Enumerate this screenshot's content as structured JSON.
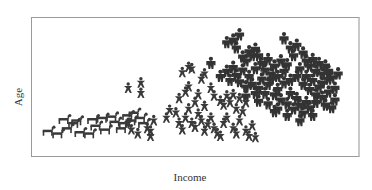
{
  "chart_data": {
    "type": "scatter",
    "title": "",
    "xlabel": "Income",
    "ylabel": "Age",
    "xlim": [
      0,
      100
    ],
    "ylim": [
      0,
      100
    ],
    "grid": false,
    "legend": null,
    "marker_colors": {
      "dog": "#3a3a3a",
      "child": "#3a3a3a",
      "adult": "#333333"
    },
    "series": [
      {
        "name": "dogs",
        "marker": "dog",
        "points": [
          [
            4,
            16
          ],
          [
            7,
            14
          ],
          [
            10,
            18
          ],
          [
            12,
            22
          ],
          [
            14,
            15
          ],
          [
            17,
            14
          ],
          [
            19,
            20
          ],
          [
            22,
            17
          ],
          [
            25,
            23
          ],
          [
            27,
            18
          ],
          [
            28,
            22
          ],
          [
            30,
            24
          ],
          [
            9,
            25
          ],
          [
            13,
            24
          ],
          [
            18,
            25
          ],
          [
            21,
            26
          ],
          [
            24,
            27
          ],
          [
            29,
            28
          ],
          [
            31,
            30
          ],
          [
            33,
            26
          ],
          [
            34,
            22
          ]
        ]
      },
      {
        "name": "children",
        "marker": "child",
        "points": [
          [
            29,
            49
          ],
          [
            33,
            53
          ],
          [
            33,
            45
          ],
          [
            29,
            22
          ],
          [
            30,
            17
          ],
          [
            32,
            14
          ],
          [
            35,
            18
          ],
          [
            36,
            12
          ],
          [
            37,
            24
          ],
          [
            36,
            16
          ],
          [
            41,
            26
          ],
          [
            42,
            32
          ],
          [
            44,
            30
          ],
          [
            45,
            22
          ],
          [
            46,
            17
          ],
          [
            47,
            26
          ],
          [
            48,
            33
          ],
          [
            49,
            22
          ],
          [
            50,
            19
          ],
          [
            51,
            29
          ],
          [
            52,
            24
          ],
          [
            53,
            16
          ],
          [
            54,
            21
          ],
          [
            55,
            26
          ],
          [
            56,
            18
          ],
          [
            57,
            14
          ],
          [
            58,
            12
          ],
          [
            59,
            22
          ],
          [
            60,
            26
          ],
          [
            62,
            18
          ],
          [
            63,
            14
          ],
          [
            64,
            24
          ],
          [
            66,
            16
          ],
          [
            67,
            12
          ],
          [
            68,
            20
          ],
          [
            69,
            11
          ],
          [
            45,
            41
          ],
          [
            47,
            46
          ],
          [
            48,
            50
          ],
          [
            52,
            56
          ],
          [
            53,
            60
          ],
          [
            55,
            49
          ],
          [
            56,
            43
          ],
          [
            58,
            39
          ],
          [
            59,
            36
          ],
          [
            60,
            43
          ],
          [
            61,
            38
          ],
          [
            62,
            44
          ],
          [
            63,
            33
          ],
          [
            64,
            41
          ],
          [
            65,
            31
          ],
          [
            66,
            38
          ],
          [
            46,
            61
          ],
          [
            48,
            65
          ],
          [
            49,
            64
          ],
          [
            50,
            38
          ],
          [
            51,
            44
          ],
          [
            53,
            35
          ]
        ]
      },
      {
        "name": "adults",
        "marker": "adult",
        "points": [
          [
            55,
            68
          ],
          [
            60,
            84
          ],
          [
            64,
            90
          ],
          [
            62,
            86
          ],
          [
            63,
            80
          ],
          [
            65,
            73
          ],
          [
            66,
            70
          ],
          [
            67,
            77
          ],
          [
            68,
            74
          ],
          [
            69,
            79
          ],
          [
            70,
            74
          ],
          [
            58,
            58
          ],
          [
            60,
            62
          ],
          [
            61,
            55
          ],
          [
            62,
            65
          ],
          [
            63,
            59
          ],
          [
            64,
            54
          ],
          [
            65,
            63
          ],
          [
            66,
            50
          ],
          [
            67,
            58
          ],
          [
            68,
            52
          ],
          [
            69,
            64
          ],
          [
            70,
            49
          ],
          [
            71,
            56
          ],
          [
            72,
            45
          ],
          [
            73,
            52
          ],
          [
            74,
            60
          ],
          [
            75,
            44
          ],
          [
            76,
            48
          ],
          [
            77,
            40
          ],
          [
            78,
            53
          ],
          [
            79,
            37
          ],
          [
            80,
            45
          ],
          [
            81,
            33
          ],
          [
            82,
            41
          ],
          [
            83,
            36
          ],
          [
            84,
            30
          ],
          [
            85,
            38
          ],
          [
            86,
            34
          ],
          [
            87,
            28
          ],
          [
            72,
            63
          ],
          [
            74,
            56
          ],
          [
            76,
            58
          ],
          [
            78,
            62
          ],
          [
            80,
            55
          ],
          [
            82,
            58
          ],
          [
            84,
            52
          ],
          [
            86,
            48
          ],
          [
            88,
            44
          ],
          [
            90,
            42
          ],
          [
            92,
            46
          ],
          [
            91,
            36
          ],
          [
            93,
            34
          ],
          [
            90,
            53
          ],
          [
            92,
            56
          ],
          [
            94,
            49
          ],
          [
            78,
            87
          ],
          [
            80,
            80
          ],
          [
            81,
            74
          ],
          [
            82,
            82
          ],
          [
            84,
            76
          ],
          [
            85,
            70
          ],
          [
            86,
            66
          ],
          [
            87,
            71
          ],
          [
            88,
            62
          ],
          [
            89,
            68
          ],
          [
            90,
            60
          ],
          [
            91,
            66
          ],
          [
            92,
            62
          ],
          [
            93,
            57
          ],
          [
            95,
            60
          ],
          [
            71,
            68
          ],
          [
            73,
            71
          ],
          [
            75,
            66
          ],
          [
            77,
            70
          ],
          [
            79,
            67
          ],
          [
            83,
            64
          ],
          [
            85,
            58
          ],
          [
            87,
            55
          ],
          [
            89,
            50
          ],
          [
            76,
            33
          ],
          [
            79,
            28
          ],
          [
            83,
            24
          ],
          [
            88,
            38
          ],
          [
            94,
            40
          ],
          [
            70,
            39
          ],
          [
            73,
            37
          ],
          [
            75,
            31
          ],
          [
            66,
            43
          ],
          [
            69,
            45
          ]
        ]
      }
    ],
    "annotations": []
  }
}
